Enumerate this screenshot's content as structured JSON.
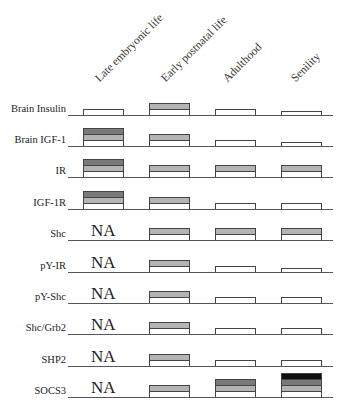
{
  "chart_data": {
    "type": "table",
    "title": "",
    "columns": [
      "Late embryonic life",
      "Early postnatal life",
      "Adulthood",
      "Senility"
    ],
    "legend_note": "Stacked level bars: 1 = white (baseline), 2 = +light gray, 3 = +mid gray, 4 = +black; 0.5 = low (short white bar); NA = not available",
    "rows": [
      {
        "label": "Brain Insulin",
        "values": [
          1,
          2,
          1,
          0.5
        ]
      },
      {
        "label": "Brain IGF-1",
        "values": [
          3,
          2,
          1,
          0.5
        ]
      },
      {
        "label": "IR",
        "values": [
          3,
          2,
          2,
          2
        ]
      },
      {
        "label": "IGF-1R",
        "values": [
          3,
          2,
          1,
          1
        ]
      },
      {
        "label": "Shc",
        "values": [
          "NA",
          2,
          2,
          2
        ]
      },
      {
        "label": "pY-IR",
        "values": [
          "NA",
          2,
          1,
          0.5
        ]
      },
      {
        "label": "pY-Shc",
        "values": [
          "NA",
          2,
          1,
          1
        ]
      },
      {
        "label": "Shc/Grb2",
        "values": [
          "NA",
          2,
          1,
          1
        ]
      },
      {
        "label": "SHP2",
        "values": [
          "NA",
          2,
          1,
          1
        ]
      },
      {
        "label": "SOCS3",
        "values": [
          "NA",
          2,
          3,
          4
        ]
      }
    ],
    "colors": {
      "level1": "#ffffff",
      "level2": "#b4b4b4",
      "level3": "#7a7a7a",
      "level4": "#111111"
    }
  },
  "headers": [
    "Late embryonic life",
    "Early postnatal life",
    "Adulthood",
    "Senility"
  ],
  "na_text": "NA"
}
